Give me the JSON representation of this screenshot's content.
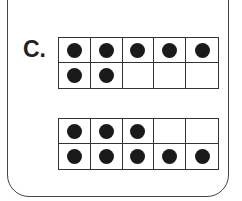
{
  "problem": {
    "label": "C.",
    "frames": [
      {
        "name": "ten-frame-top",
        "top": 37,
        "rows": [
          [
            true,
            true,
            true,
            true,
            true
          ],
          [
            true,
            true,
            false,
            false,
            false
          ]
        ],
        "count": 7
      },
      {
        "name": "ten-frame-bottom",
        "top": 118,
        "rows": [
          [
            true,
            true,
            true,
            false,
            false
          ],
          [
            true,
            true,
            true,
            true,
            true
          ]
        ],
        "count": 8
      }
    ]
  },
  "colors": {
    "dot": "#1a1a1a",
    "border": "#333333",
    "background": "#ffffff"
  }
}
